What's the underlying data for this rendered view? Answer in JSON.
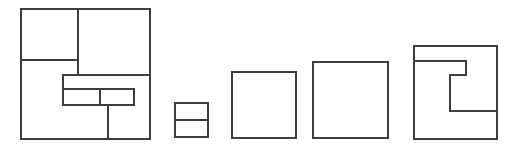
{
  "figure": {
    "background_color": "#ffffff",
    "stroke_color": "#3d3d42",
    "stroke_width": 1.15,
    "canvas": {
      "width": 515,
      "height": 153
    },
    "shape_count": 5,
    "shapes": [
      {
        "index": 1,
        "name": "large-subdivided-square",
        "description": "Large square partitioned into an upper-left cell, an upper-right cell, a nested inner rectangle split in two, and a lower strip divided by a vertical line",
        "outer": {
          "x": 21,
          "y": 9,
          "width": 129,
          "height": 130
        },
        "segments": [
          {
            "name": "vertical-divider-top",
            "x1": 78,
            "y1": 9,
            "x2": 78,
            "y2": 75
          },
          {
            "name": "horizontal-divider-upper-left",
            "x1": 21,
            "y1": 60,
            "x2": 78,
            "y2": 60
          },
          {
            "name": "horizontal-divider-mid",
            "x1": 63,
            "y1": 75,
            "x2": 150,
            "y2": 75
          },
          {
            "name": "inner-rect-left-edge",
            "x1": 63,
            "y1": 75,
            "x2": 63,
            "y2": 105
          },
          {
            "name": "inner-rect-bottom-edge",
            "x1": 63,
            "y1": 105,
            "x2": 134,
            "y2": 105
          },
          {
            "name": "inner-rect-right-edge",
            "x1": 134,
            "y1": 89,
            "x2": 134,
            "y2": 105
          },
          {
            "name": "inner-rect-horizontal-split",
            "x1": 63,
            "y1": 89,
            "x2": 134,
            "y2": 89
          },
          {
            "name": "inner-rect-vertical-split",
            "x1": 100,
            "y1": 89,
            "x2": 100,
            "y2": 105
          },
          {
            "name": "vertical-divider-bottom",
            "x1": 108,
            "y1": 105,
            "x2": 108,
            "y2": 139
          }
        ]
      },
      {
        "index": 2,
        "name": "small-split-square",
        "description": "Small square divided by a single horizontal line into two stacked cells",
        "outer": {
          "x": 175,
          "y": 103,
          "width": 33,
          "height": 34
        },
        "segments": [
          {
            "name": "horizontal-split",
            "x1": 175,
            "y1": 120,
            "x2": 208,
            "y2": 120
          }
        ]
      },
      {
        "index": 3,
        "name": "plain-square-medium",
        "description": "Empty square with no internal divisions",
        "outer": {
          "x": 232,
          "y": 72,
          "width": 64,
          "height": 66
        },
        "segments": []
      },
      {
        "index": 4,
        "name": "plain-square-large",
        "description": "Empty square with no internal divisions, larger than the previous",
        "outer": {
          "x": 313,
          "y": 62,
          "width": 75,
          "height": 76
        },
        "segments": []
      },
      {
        "index": 5,
        "name": "spiral-hook-square",
        "description": "Largest square containing an inward spiral hook drawn from the left edge",
        "outer": {
          "x": 414,
          "y": 46,
          "width": 83,
          "height": 93
        },
        "spiral_path": "M 414 61 L 466 61 L 466 75 L 450 75 L 450 111 L 497 111",
        "segments": []
      }
    ]
  }
}
